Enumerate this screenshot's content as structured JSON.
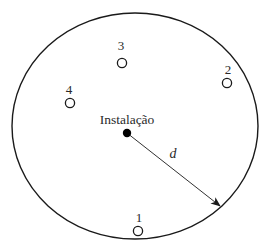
{
  "diagram": {
    "boundary": {
      "cx": 135,
      "cy": 126,
      "rx": 123,
      "ry": 113,
      "stroke": "#1a1a1a"
    },
    "facility": {
      "label": "Instalação",
      "x": 127,
      "y": 133,
      "r": 4.2,
      "label_x": 127,
      "label_y": 124,
      "fill": "#000000"
    },
    "radius": {
      "label": "d",
      "x1": 127,
      "y1": 133,
      "x2": 220,
      "y2": 206,
      "label_x": 173,
      "label_y": 158
    },
    "points": [
      {
        "id": "1",
        "label": "1",
        "x": 138,
        "y": 231,
        "label_x": 139,
        "label_y": 222
      },
      {
        "id": "2",
        "label": "2",
        "x": 227,
        "y": 83,
        "label_x": 228,
        "label_y": 74
      },
      {
        "id": "3",
        "label": "3",
        "x": 122,
        "y": 63,
        "label_x": 121,
        "label_y": 50
      },
      {
        "id": "4",
        "label": "4",
        "x": 70,
        "y": 103,
        "label_x": 69,
        "label_y": 94
      }
    ]
  }
}
